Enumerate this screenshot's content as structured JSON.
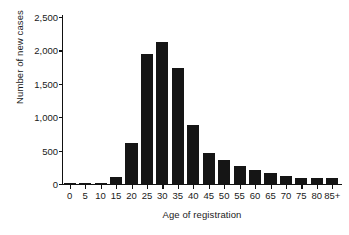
{
  "chart_data": {
    "type": "bar",
    "title": "",
    "subtitle": "",
    "xlabel": "Age of registration",
    "ylabel": "Number of new cases",
    "categories": [
      "0",
      "5",
      "10",
      "15",
      "20",
      "25",
      "30",
      "35",
      "40",
      "45",
      "50",
      "55",
      "60",
      "65",
      "70",
      "75",
      "80",
      "85+"
    ],
    "values": [
      10,
      15,
      20,
      100,
      620,
      1950,
      2120,
      1730,
      890,
      470,
      360,
      270,
      215,
      165,
      115,
      95,
      90,
      85
    ],
    "series": [
      {
        "name": "New cases",
        "values": [
          10,
          15,
          20,
          100,
          620,
          1950,
          2120,
          1730,
          890,
          470,
          360,
          270,
          215,
          165,
          115,
          95,
          90,
          85
        ]
      }
    ],
    "xlim": [
      0,
      18
    ],
    "ylim": [
      0,
      2500
    ],
    "ytick_values": [
      0,
      500,
      1000,
      1500,
      2000,
      2500
    ],
    "ytick_labels": [
      "0",
      "500",
      "1,000",
      "1,500",
      "2,000",
      "2,500"
    ],
    "xtick_labels": [
      "0",
      "5",
      "10",
      "15",
      "20",
      "25",
      "30",
      "35",
      "40",
      "45",
      "50",
      "55",
      "60",
      "65",
      "70",
      "75",
      "80",
      "85+"
    ],
    "grid": false,
    "legend": false,
    "legend_position": "none",
    "bar_color": "#151515",
    "axis_color": "#111111",
    "background_color": "#ffffff",
    "annotations": []
  }
}
